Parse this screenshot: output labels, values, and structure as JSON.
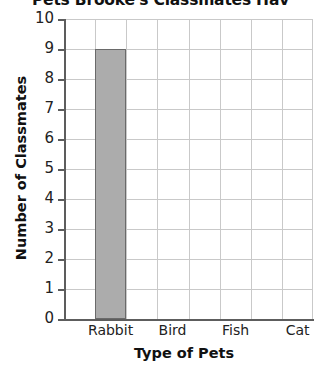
{
  "chart_data": {
    "type": "bar",
    "title": "Pets Brooke's Classmates Hav",
    "xlabel": "Type of Pets",
    "ylabel": "Number of Classmates",
    "categories": [
      "Rabbit",
      "Bird",
      "Fish",
      "Cat"
    ],
    "values": [
      9,
      0,
      0,
      0
    ],
    "ylim": [
      0,
      10
    ],
    "ytick_step": 1,
    "yticks": [
      "10",
      "9",
      "8",
      "7",
      "6",
      "5",
      "4",
      "3",
      "2",
      "1",
      "0"
    ],
    "grid": true,
    "legend": "none",
    "bar_fill_color": "#acacac",
    "bar_border_color": "#6a6a6a",
    "grid_color": "#c9c9c9",
    "axis_color": "#5d5d5d"
  }
}
